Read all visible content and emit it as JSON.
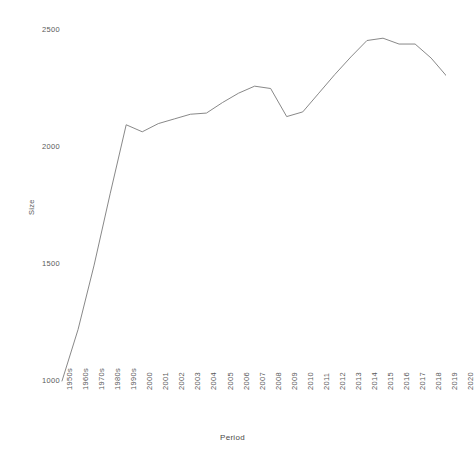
{
  "chart_data": {
    "type": "line",
    "title": "",
    "xlabel": "Period",
    "ylabel": "Size",
    "grid": false,
    "legend": "none",
    "xlim_categories_first": "1950s",
    "xlim_categories_last": "2020",
    "ylim": [
      1000,
      2500
    ],
    "y_ticks": [
      1000,
      1500,
      2000,
      2500
    ],
    "y_tick_labels": [
      "1000",
      "1500",
      "2000",
      "2500"
    ],
    "categories": [
      "1950s",
      "1960s",
      "1970s",
      "1980s",
      "1990s",
      "2000",
      "2001",
      "2002",
      "2003",
      "2004",
      "2005",
      "2006",
      "2007",
      "2008",
      "2009",
      "2010",
      "2011",
      "2012",
      "2013",
      "2014",
      "2015",
      "2016",
      "2017",
      "2018",
      "2019",
      "2020"
    ],
    "series": [
      {
        "name": "Size",
        "color": "#7a7a7a",
        "values": [
          1000,
          1220,
          1495,
          1800,
          2095,
          2065,
          2100,
          2120,
          2140,
          2145,
          2190,
          2230,
          2260,
          2250,
          2130,
          2150,
          2230,
          2310,
          2385,
          2455,
          2465,
          2440,
          2440,
          2380,
          2300,
          2270
        ]
      }
    ]
  },
  "axes": {
    "y_title": "Size",
    "x_title": "Period"
  }
}
